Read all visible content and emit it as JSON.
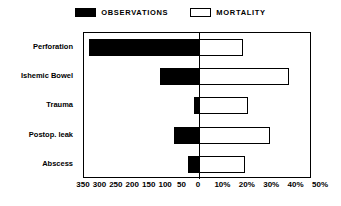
{
  "chart_data": {
    "type": "bar",
    "orientation": "horizontal",
    "style": "back-to-back-diverging",
    "title": "",
    "subtitle": "",
    "xlabel": "",
    "ylabel": "",
    "grid": false,
    "legend_position": "top-center",
    "categories": [
      "Perforation",
      "Ishemic Bowel",
      "Trauma",
      "Postop. leak",
      "Abscess"
    ],
    "series": [
      {
        "name": "OBSERVATIONS",
        "side": "left",
        "fill": "#000000",
        "unit": "count",
        "axis_range": [
          0,
          350
        ],
        "axis_direction": "reversed",
        "values": [
          335,
          120,
          15,
          75,
          35
        ]
      },
      {
        "name": "MORTALITY",
        "side": "right",
        "fill": "#ffffff",
        "unit": "percent",
        "axis_range": [
          0,
          50
        ],
        "axis_direction": "normal",
        "values": [
          18,
          37,
          20,
          29,
          19
        ]
      }
    ],
    "left_ticks": [
      "350",
      "300",
      "250",
      "200",
      "150",
      "100",
      "50",
      "0"
    ],
    "left_tick_values": [
      350,
      300,
      250,
      200,
      150,
      100,
      50,
      0
    ],
    "right_ticks": [
      "0",
      "10%",
      "20%",
      "30%",
      "40%",
      "50%"
    ],
    "right_tick_values": [
      0,
      10,
      20,
      30,
      40,
      50
    ]
  },
  "legend": {
    "entries": [
      {
        "label": "OBSERVATIONS",
        "swatch": "filled-square-swatch"
      },
      {
        "label": "MORTALITY",
        "swatch": "hollow-square-swatch"
      }
    ]
  },
  "colors": {
    "observations": "#000000",
    "mortality": "#ffffff",
    "axis": "#000000",
    "background": "#ffffff"
  }
}
